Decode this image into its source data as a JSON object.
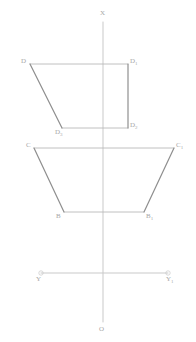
{
  "drawing": {
    "title": "descriptive-geometry-projection",
    "width": 196,
    "height": 342,
    "background": "#ffffff",
    "axis_color": "#c9c9c9",
    "shape_light_color": "#b9b9b9",
    "shape_dark_color": "#8f8f8f",
    "label_color": "#a8a8a8"
  },
  "axes": {
    "vertical": {
      "name": "x-axis",
      "x": 103,
      "y_top": 22,
      "y_bottom": 322,
      "top_label": "X",
      "bottom_label": "O"
    },
    "horizontal": {
      "name": "y-axis",
      "y": 273,
      "x_left": 41,
      "x_right": 168,
      "left_label": "Y",
      "right_label": "Y",
      "left_sub": "1",
      "right_sub": "1",
      "endpoint_radius": 2.2
    }
  },
  "upper_figure": {
    "name": "upper-projection",
    "vertices": [
      {
        "label": "D",
        "sub": "",
        "x": 30,
        "y": 64
      },
      {
        "label": "D",
        "sub": "1",
        "x": 128,
        "y": 64
      },
      {
        "label": "D",
        "sub": "2",
        "x": 128,
        "y": 128
      },
      {
        "label": "D",
        "sub": "3",
        "x": 62,
        "y": 128
      }
    ],
    "edges_light": [
      {
        "x1": 30,
        "y1": 64,
        "x2": 128,
        "y2": 64
      },
      {
        "x1": 62,
        "y1": 128,
        "x2": 128,
        "y2": 128
      }
    ],
    "edges_dark": [
      {
        "x1": 30,
        "y1": 64,
        "x2": 62,
        "y2": 128
      },
      {
        "x1": 128,
        "y1": 64,
        "x2": 128,
        "y2": 128
      }
    ]
  },
  "lower_figure": {
    "name": "lower-projection",
    "vertices": [
      {
        "label": "C",
        "sub": "",
        "x": 34,
        "y": 148
      },
      {
        "label": "C",
        "sub": "1",
        "x": 174,
        "y": 148
      },
      {
        "label": "B",
        "sub": "1",
        "x": 144,
        "y": 212
      },
      {
        "label": "B",
        "sub": "",
        "x": 64,
        "y": 212
      }
    ],
    "edges_light": [
      {
        "x1": 34,
        "y1": 148,
        "x2": 174,
        "y2": 148
      },
      {
        "x1": 64,
        "y1": 212,
        "x2": 144,
        "y2": 212
      }
    ],
    "edges_dark": [
      {
        "x1": 34,
        "y1": 148,
        "x2": 64,
        "y2": 212
      },
      {
        "x1": 174,
        "y1": 148,
        "x2": 144,
        "y2": 212
      }
    ]
  },
  "labels": [
    {
      "id": "lbl-x",
      "text": "X",
      "sub": "",
      "x": 100,
      "y": 10,
      "rotate": false
    },
    {
      "id": "lbl-o",
      "text": "O",
      "sub": "",
      "x": 99,
      "y": 326,
      "rotate": false
    },
    {
      "id": "lbl-d",
      "text": "D",
      "sub": "",
      "x": 21,
      "y": 58,
      "rotate": false
    },
    {
      "id": "lbl-d1",
      "text": "D",
      "sub": "1",
      "x": 130,
      "y": 58,
      "rotate": false
    },
    {
      "id": "lbl-d2",
      "text": "D",
      "sub": "2",
      "x": 130,
      "y": 122,
      "rotate": false
    },
    {
      "id": "lbl-d3",
      "text": "D",
      "sub": "3",
      "x": 55,
      "y": 129,
      "rotate": false
    },
    {
      "id": "lbl-c",
      "text": "C",
      "sub": "",
      "x": 26,
      "y": 142,
      "rotate": false
    },
    {
      "id": "lbl-c1",
      "text": "C",
      "sub": "1",
      "x": 176,
      "y": 142,
      "rotate": false
    },
    {
      "id": "lbl-b",
      "text": "B",
      "sub": "",
      "x": 56,
      "y": 213,
      "rotate": false
    },
    {
      "id": "lbl-b1",
      "text": "B",
      "sub": "1",
      "x": 146,
      "y": 213,
      "rotate": false
    },
    {
      "id": "lbl-y",
      "text": "Y",
      "sub": "",
      "x": 36,
      "y": 276,
      "rotate": false
    },
    {
      "id": "lbl-y1",
      "text": "Y",
      "sub": "1",
      "x": 166,
      "y": 276,
      "rotate": false
    }
  ]
}
